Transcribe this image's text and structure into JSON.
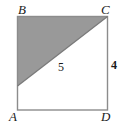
{
  "figure": {
    "shape": "square",
    "background_color": "#ffffff",
    "shaded_fill_color": "#999999",
    "stroke_color": "#8c8c8c",
    "label_color": "#1a1a1a",
    "vertices": [
      {
        "id": "B",
        "label": "B",
        "position": "top-left"
      },
      {
        "id": "C",
        "label": "C",
        "position": "top-right"
      },
      {
        "id": "A",
        "label": "A",
        "position": "bottom-left"
      },
      {
        "id": "D",
        "label": "D",
        "position": "bottom-right"
      }
    ],
    "measures": [
      {
        "id": "hypotenuse",
        "label": "5",
        "on": "diagonal-from-left-edge-to-C"
      },
      {
        "id": "right-side",
        "label": "4",
        "on": "segment-CD"
      }
    ],
    "shaded_region": {
      "type": "triangle",
      "points": "B (top-left corner), C (top-right corner), point on left edge below B",
      "fill": "#999999"
    }
  }
}
